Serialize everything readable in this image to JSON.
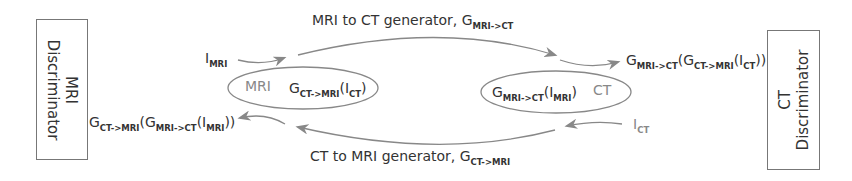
{
  "diagram": {
    "mri_discriminator": {
      "line1": "MRI",
      "line2": "Discriminator"
    },
    "ct_discriminator": {
      "line1": "CT",
      "line2": "Discriminator"
    },
    "top_generator": {
      "label": "MRI to CT generator, G",
      "sub": "MRI->CT"
    },
    "bottom_generator": {
      "label": "CT to MRI generator, G",
      "sub": "CT->MRI"
    },
    "input_mri": {
      "main": "I",
      "sub": "MRI"
    },
    "input_ct": {
      "main": "I",
      "sub": "CT"
    },
    "left_ellipse": {
      "domain": "MRI",
      "g": "G",
      "g_sub": "CT->MRI",
      "paren_open": "(I",
      "arg_sub": "CT",
      "paren_close": ")"
    },
    "right_ellipse": {
      "domain": "CT",
      "g": "G",
      "g_sub": "MRI->CT",
      "paren_open": "(I",
      "arg_sub": "MRI",
      "paren_close": ")"
    },
    "left_output": {
      "g1": "G",
      "g1_sub": "CT->MRI",
      "g2": "(G",
      "g2_sub": "MRI->CT",
      "i": "(I",
      "i_sub": "MRI",
      "close": "))"
    },
    "right_output": {
      "g1": "G",
      "g1_sub": "MRI->CT",
      "g2": "(G",
      "g2_sub": "CT->MRI",
      "i": "(I",
      "i_sub": "CT",
      "close": "))"
    },
    "colors": {
      "line": "#888888",
      "text": "#333333",
      "box_border": "#777777"
    }
  }
}
